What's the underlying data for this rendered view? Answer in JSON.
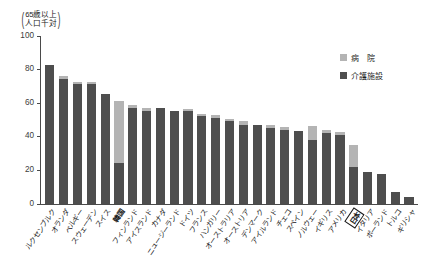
{
  "axis_unit": {
    "line1": "65歳以上",
    "line2": "人口千対"
  },
  "legend": {
    "position": "top-right",
    "items": [
      {
        "label": "病　院",
        "color": "#b4b4b4",
        "key": "hospital"
      },
      {
        "label": "介護施設",
        "color": "#4e4e4e",
        "key": "facility"
      }
    ]
  },
  "chart_data": {
    "type": "bar",
    "title": "",
    "subtitle": "",
    "xlabel": "",
    "ylabel": "65歳以上人口千対",
    "ylim": [
      0,
      100
    ],
    "yticks": [
      0,
      20,
      40,
      60,
      80,
      100
    ],
    "ytick_labels": [
      "0",
      "20",
      "40",
      "60",
      "80",
      "100"
    ],
    "grid": false,
    "stacked": true,
    "legend_position": "top-right",
    "categories": [
      "ルクセンブルク",
      "オランダ",
      "ベルギー",
      "スウェーデン",
      "スイス",
      "韓国",
      "フィンランド",
      "アイスランド",
      "カナダ",
      "ニュージーランド",
      "ドイツ",
      "フランス",
      "ハンガリー",
      "オーストラリア",
      "オーストリア",
      "デンマーク",
      "アイルランド",
      "チェコ",
      "スペイン",
      "ノルウェー",
      "イギリス",
      "アメリカ",
      "日本",
      "イタリア",
      "ポーランド",
      "トルコ",
      "ギリシャ"
    ],
    "highlight_category": "日本",
    "bold_categories": [
      "韓国",
      "日本"
    ],
    "series": [
      {
        "name": "介護施設",
        "color": "#4e4e4e",
        "values": [
          82,
          74,
          71,
          71,
          65,
          24,
          57,
          55,
          57,
          55,
          55,
          52,
          51,
          49,
          47,
          47,
          45,
          44,
          43,
          38,
          42,
          41,
          22,
          19,
          18,
          7,
          4
        ]
      },
      {
        "name": "病　院",
        "color": "#b4b4b4",
        "values": [
          0,
          1.5,
          1,
          1,
          0,
          37,
          1.5,
          2,
          0,
          0,
          1.5,
          1.5,
          1.5,
          1.5,
          2,
          0,
          2,
          1.5,
          0,
          8,
          2,
          1.5,
          13,
          0,
          0,
          0,
          0
        ]
      }
    ],
    "totals": [
      82,
      75.5,
      72,
      72,
      65,
      61,
      58.5,
      57,
      57,
      55,
      56.5,
      53.5,
      52.5,
      50.5,
      49,
      47,
      47,
      45.5,
      43,
      46,
      44,
      42.5,
      35,
      19,
      18,
      7,
      4
    ]
  }
}
